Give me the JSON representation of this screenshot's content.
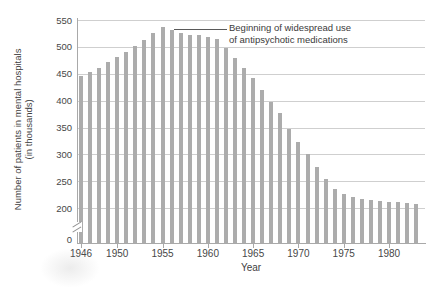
{
  "annotation": {
    "line1": "Beginning of widespread use",
    "line2": "of antipsychotic medications"
  },
  "colors": {
    "bar": "#acacac",
    "gridline": "#cfcfcf",
    "axis": "#a9a9a9",
    "text": "#3f3f3f"
  },
  "chart_data": {
    "type": "bar",
    "title": "",
    "xlabel": "Year",
    "ylabel_line1": "Number of patients in mental hospitals",
    "ylabel_line2": "(in thousands)",
    "years": [
      1946,
      1947,
      1948,
      1949,
      1950,
      1951,
      1952,
      1953,
      1954,
      1955,
      1956,
      1957,
      1958,
      1959,
      1960,
      1961,
      1962,
      1963,
      1964,
      1965,
      1966,
      1967,
      1968,
      1969,
      1970,
      1971,
      1972,
      1973,
      1974,
      1975,
      1976,
      1977,
      1978,
      1979,
      1980,
      1981,
      1982,
      1983
    ],
    "values": [
      445,
      453,
      461,
      471,
      482,
      491,
      502,
      513,
      526,
      537,
      532,
      525,
      523,
      522,
      519,
      515,
      497,
      480,
      461,
      442,
      420,
      398,
      377,
      348,
      324,
      300,
      276,
      254,
      235,
      226,
      220,
      217,
      215,
      213,
      212,
      211,
      210,
      208
    ],
    "y_ticks": [
      0,
      200,
      250,
      300,
      350,
      400,
      450,
      500,
      550
    ],
    "x_tick_labels": [
      1946,
      1950,
      1955,
      1960,
      1965,
      1970,
      1975,
      1980
    ],
    "ylim_display": [
      200,
      550
    ],
    "axis_break": true,
    "grid": true,
    "legend": "none",
    "annotation_target_year": 1956
  }
}
